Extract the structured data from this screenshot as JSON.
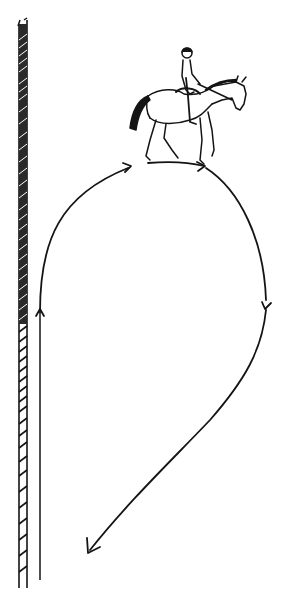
{
  "diagram": {
    "type": "riding-figure",
    "colors": {
      "ink": "#141414",
      "background": "#ffffff"
    },
    "elements": {
      "wall": {
        "label": "arena-wall",
        "x": 22,
        "y_top": 22,
        "y_bottom": 588
      },
      "track": {
        "label": "track-line",
        "x": 40,
        "y_top": 310,
        "y_bottom": 580
      },
      "horse_rider": {
        "label": "horse-and-rider",
        "position": "top-center"
      },
      "path": {
        "label": "teardrop-path",
        "arrows": [
          {
            "name": "up-track-arrow",
            "x": 40,
            "y": 312,
            "direction": "up"
          },
          {
            "name": "top-left-arrow",
            "x": 131,
            "y": 166,
            "direction": "right"
          },
          {
            "name": "top-right-arrow",
            "x": 203,
            "y": 167,
            "direction": "right"
          },
          {
            "name": "right-side-arrow",
            "x": 265,
            "y": 306,
            "direction": "down"
          },
          {
            "name": "end-arrow",
            "x": 88,
            "y": 553,
            "direction": "down-left"
          }
        ]
      }
    }
  }
}
